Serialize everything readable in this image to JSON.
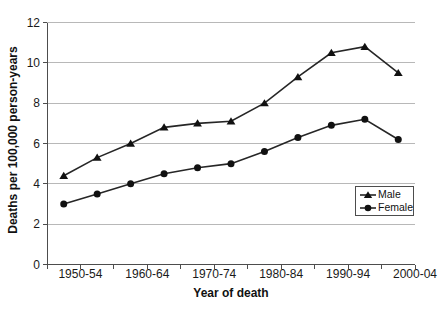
{
  "chart_data": {
    "type": "line",
    "title": "",
    "xlabel": "Year of death",
    "ylabel": "Deaths per 100,000 person-years",
    "categories": [
      "1950-54",
      "1955-59",
      "1960-64",
      "1965-69",
      "1970-74",
      "1975-79",
      "1980-84",
      "1985-89",
      "1990-94",
      "1995-99",
      "2000-04"
    ],
    "x_tick_labels": [
      "1950-54",
      "1960-64",
      "1970-74",
      "1980-84",
      "1990-94",
      "2000-04"
    ],
    "y_ticks": [
      0,
      2,
      4,
      6,
      8,
      10,
      12
    ],
    "ylim": [
      0,
      12
    ],
    "grid": "horizontal",
    "legend_position": "inside-right",
    "series": [
      {
        "name": "Male",
        "marker": "triangle",
        "values": [
          4.4,
          5.3,
          6.0,
          6.8,
          7.0,
          7.1,
          8.0,
          9.3,
          10.5,
          10.8,
          9.5
        ]
      },
      {
        "name": "Female",
        "marker": "circle",
        "values": [
          3.0,
          3.5,
          4.0,
          4.5,
          4.8,
          5.0,
          5.6,
          6.3,
          6.9,
          7.2,
          6.2
        ]
      }
    ],
    "colors": {
      "line": "#262626",
      "marker": "#111111",
      "grid": "#b8b8b8",
      "axis": "#4d4d4d",
      "text": "#1a1a1a",
      "background": "#ffffff"
    }
  }
}
